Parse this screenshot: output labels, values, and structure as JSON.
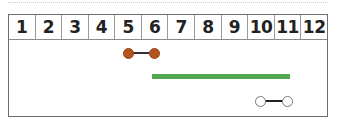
{
  "timeline": {
    "columns": [
      "1",
      "2",
      "3",
      "4",
      "5",
      "6",
      "7",
      "8",
      "9",
      "10",
      "11",
      "12"
    ],
    "segments": [
      {
        "name": "brown-dumbbell",
        "style": "dumbbell-filled",
        "start": 5,
        "end": 6,
        "color": "#b5531f",
        "line_color": "#333333"
      },
      {
        "name": "green-bar",
        "style": "bar",
        "start": 6,
        "end": 11,
        "color": "#52a84e"
      },
      {
        "name": "white-dumbbell",
        "style": "dumbbell-open",
        "start": 10,
        "end": 11,
        "color": "#ffffff",
        "line_color": "#222222"
      }
    ]
  },
  "colors": {
    "border": "#6e6e6e",
    "brown": "#b5531f",
    "green": "#52a84e"
  }
}
